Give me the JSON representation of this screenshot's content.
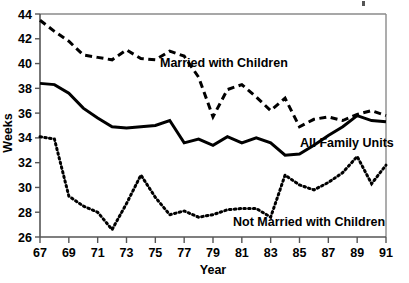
{
  "chart_data": {
    "type": "line",
    "title": "",
    "xlabel": "Year",
    "ylabel": "Weeks",
    "xlim": [
      67,
      91
    ],
    "ylim": [
      26,
      44
    ],
    "xticks": [
      67,
      69,
      71,
      73,
      75,
      77,
      79,
      81,
      83,
      85,
      87,
      89,
      91
    ],
    "yticks": [
      26,
      28,
      30,
      32,
      34,
      36,
      38,
      40,
      42,
      44
    ],
    "xtick_labels": [
      "67",
      "69",
      "71",
      "73",
      "75",
      "77",
      "79",
      "81",
      "83",
      "85",
      "87",
      "89",
      "91"
    ],
    "ytick_labels": [
      "26",
      "28",
      "30",
      "32",
      "34",
      "36",
      "38",
      "40",
      "42",
      "44"
    ],
    "grid": false,
    "legend_position": "inline-annotations",
    "x": [
      67,
      68,
      69,
      70,
      71,
      72,
      73,
      74,
      75,
      76,
      77,
      78,
      79,
      80,
      81,
      82,
      83,
      84,
      85,
      86,
      87,
      88,
      89,
      90,
      91
    ],
    "series": [
      {
        "name": "Married with Children",
        "style": "dashed",
        "values": [
          43.5,
          42.6,
          41.8,
          40.7,
          40.5,
          40.3,
          41.1,
          40.4,
          40.3,
          41.0,
          40.6,
          38.9,
          35.7,
          37.9,
          38.3,
          37.3,
          36.2,
          37.2,
          34.9,
          35.5,
          35.7,
          35.4,
          35.9,
          36.2,
          35.8
        ]
      },
      {
        "name": "All Family Units",
        "style": "solid",
        "values": [
          38.4,
          38.3,
          37.6,
          36.4,
          35.6,
          34.9,
          34.8,
          34.9,
          35.0,
          35.4,
          33.6,
          33.9,
          33.4,
          34.1,
          33.6,
          34.0,
          33.6,
          32.6,
          32.7,
          33.4,
          34.2,
          34.9,
          35.8,
          35.4,
          35.3
        ]
      },
      {
        "name": "Not Married with Children",
        "style": "dotted",
        "values": [
          34.1,
          33.9,
          29.3,
          28.5,
          28.0,
          26.6,
          28.7,
          31.0,
          29.2,
          27.8,
          28.1,
          27.6,
          27.8,
          28.2,
          28.3,
          28.3,
          27.6,
          31.0,
          30.2,
          29.8,
          30.4,
          31.2,
          32.5,
          30.3,
          31.8
        ]
      }
    ],
    "annotations": [
      {
        "name": "married-with-children-label",
        "text": "Married with Children",
        "x_px": 160,
        "y_px": 67
      },
      {
        "name": "all-family-units-label",
        "text": "All Family Units",
        "x_px": 300,
        "y_px": 147
      },
      {
        "name": "not-married-with-children-label",
        "text": "Not Married with Children",
        "x_px": 233,
        "y_px": 226
      }
    ]
  },
  "axes": {
    "x_axis_title": "Year",
    "y_axis_title": "Weeks"
  }
}
